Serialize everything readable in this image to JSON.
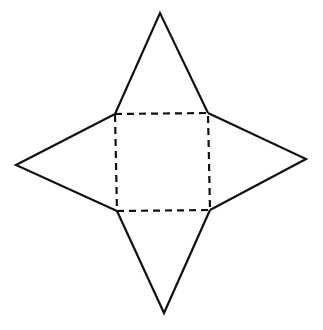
{
  "diagram": {
    "type": "pyramid-net",
    "colors": {
      "line": "#111111",
      "background": "#ffffff"
    },
    "base": {
      "style": "dashed",
      "corners": [
        [
          115,
          114
        ],
        [
          208,
          113
        ],
        [
          210,
          210
        ],
        [
          117,
          211
        ]
      ]
    },
    "triangles": [
      {
        "name": "top",
        "apex": [
          160,
          13
        ],
        "base": [
          [
            115,
            114
          ],
          [
            208,
            113
          ]
        ]
      },
      {
        "name": "right",
        "apex": [
          306,
          159
        ],
        "base": [
          [
            208,
            113
          ],
          [
            210,
            210
          ]
        ]
      },
      {
        "name": "bottom",
        "apex": [
          164,
          313
        ],
        "base": [
          [
            210,
            210
          ],
          [
            117,
            211
          ]
        ]
      },
      {
        "name": "left",
        "apex": [
          16,
          165
        ],
        "base": [
          [
            117,
            211
          ],
          [
            115,
            114
          ]
        ]
      }
    ]
  }
}
